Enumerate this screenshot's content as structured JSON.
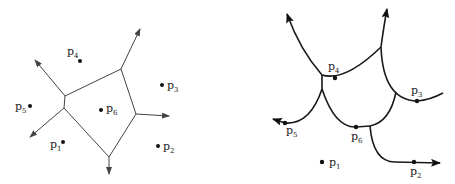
{
  "left_diagram": {
    "title": "Voronoi diagram",
    "points": [
      {
        "id": "p1",
        "label": "p",
        "sub": "1"
      },
      {
        "id": "p2",
        "label": "p",
        "sub": "2"
      },
      {
        "id": "p3",
        "label": "p",
        "sub": "3"
      },
      {
        "id": "p4",
        "label": "p",
        "sub": "4"
      },
      {
        "id": "p5",
        "label": "p",
        "sub": "5"
      },
      {
        "id": "p6",
        "label": "p",
        "sub": "6"
      }
    ]
  },
  "right_diagram": {
    "title": "Transformed diagram with curved edges",
    "points": [
      {
        "id": "p1",
        "label": "p",
        "sub": "1"
      },
      {
        "id": "p2",
        "label": "p",
        "sub": "2"
      },
      {
        "id": "p3",
        "label": "p",
        "sub": "3"
      },
      {
        "id": "p4",
        "label": "p",
        "sub": "4"
      },
      {
        "id": "p5",
        "label": "p",
        "sub": "5"
      },
      {
        "id": "p6",
        "label": "p",
        "sub": "6"
      }
    ]
  },
  "colors": {
    "line": "#444444",
    "thick_line": "#1a1a1a",
    "dot": "#111111"
  }
}
